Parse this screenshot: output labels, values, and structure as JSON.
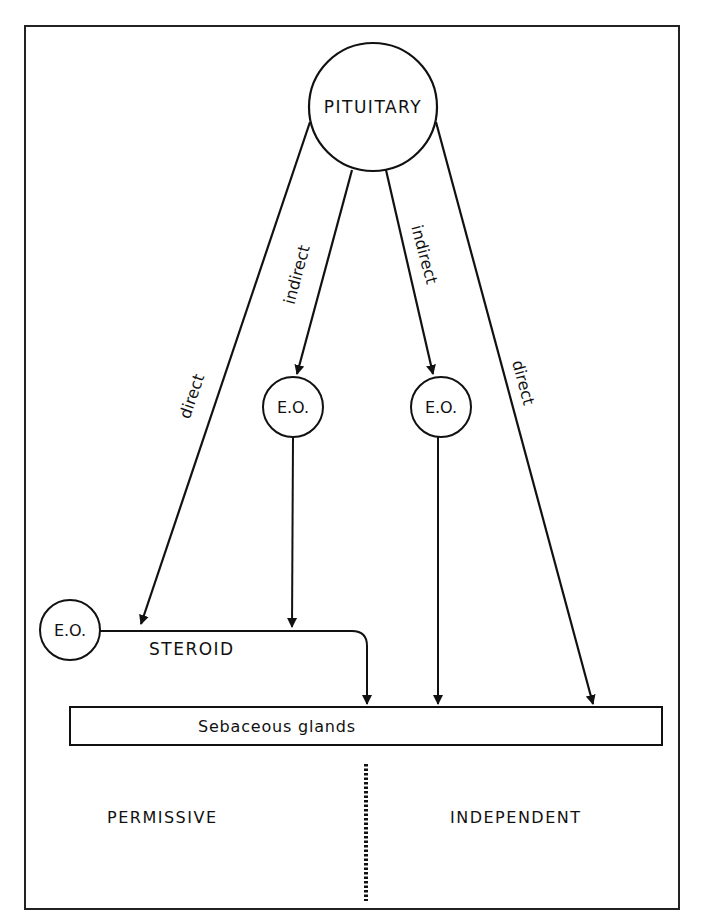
{
  "diagram": {
    "nodes": {
      "pituitary": "PITUITARY",
      "eo_left": "E.O.",
      "eo_middle_left": "E.O.",
      "eo_middle_right": "E.O.",
      "target": "Sebaceous glands"
    },
    "edges": {
      "left_direct": "direct",
      "left_indirect": "indirect",
      "right_indirect": "indirect",
      "right_direct": "direct",
      "steroid": "STEROID"
    },
    "regions": {
      "left": "PERMISSIVE",
      "right": "INDEPENDENT"
    },
    "colors": {
      "ink": "#111111",
      "background": "#ffffff"
    }
  }
}
